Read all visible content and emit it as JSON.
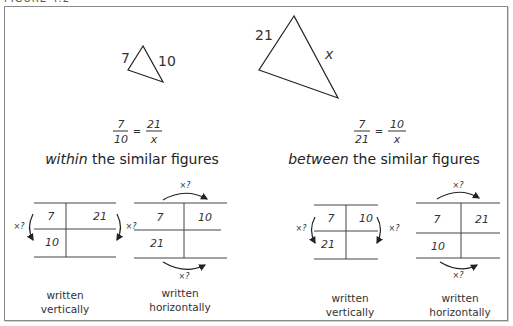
{
  "figure": {
    "caption": "FIGURE 4.2"
  },
  "triangles": {
    "small": {
      "side_a": "7",
      "side_b": "10"
    },
    "large": {
      "side_a": "21",
      "side_b": "x"
    }
  },
  "within": {
    "proportion": {
      "left_num": "7",
      "left_den": "10",
      "equals": "=",
      "right_num": "21",
      "right_den": "x"
    },
    "heading_em": "within",
    "heading_rest": " the similar figures",
    "vertical_table": {
      "cells": {
        "top_left": "7",
        "top_right": "21",
        "bottom_left": "10",
        "bottom_right": ""
      },
      "arrow_left": "×?",
      "arrow_right": "×?",
      "label_line1": "written",
      "label_line2": "vertically"
    },
    "horizontal_table": {
      "cells": {
        "top_left": "7",
        "top_right": "10",
        "bottom_left": "21",
        "bottom_right": ""
      },
      "arrow_top": "×?",
      "arrow_bottom": "×?",
      "label_line1": "written",
      "label_line2": "horizontally"
    }
  },
  "between": {
    "proportion": {
      "left_num": "7",
      "left_den": "21",
      "equals": "=",
      "right_num": "10",
      "right_den": "x"
    },
    "heading_em": "between",
    "heading_rest": " the similar figures",
    "vertical_table": {
      "cells": {
        "top_left": "7",
        "top_right": "10",
        "bottom_left": "21",
        "bottom_right": ""
      },
      "arrow_left": "×?",
      "arrow_right": "×?",
      "label_line1": "written",
      "label_line2": "vertically"
    },
    "horizontal_table": {
      "cells": {
        "top_left": "7",
        "top_right": "21",
        "bottom_left": "10",
        "bottom_right": ""
      },
      "arrow_top": "×?",
      "arrow_bottom": "×?",
      "label_line1": "written",
      "label_line2": "horizontally"
    }
  },
  "colors": {
    "ink": "#222222",
    "frame": "#8a8a8a",
    "background": "#ffffff"
  }
}
